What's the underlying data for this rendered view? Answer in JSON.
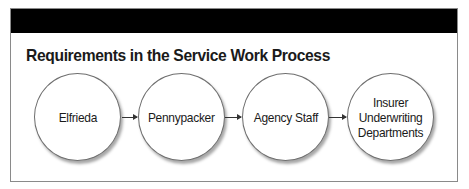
{
  "diagram": {
    "title": "Requirements in the Service Work Process",
    "header_band_color": "#000000",
    "nodes": [
      {
        "label": "Elfrieda"
      },
      {
        "label": "Pennypacker"
      },
      {
        "label": "Agency Staff"
      },
      {
        "label": "Insurer\nUnderwriting\nDepartments"
      }
    ],
    "edges": [
      {
        "from": "Elfrieda",
        "to": "Pennypacker"
      },
      {
        "from": "Pennypacker",
        "to": "Agency Staff"
      },
      {
        "from": "Agency Staff",
        "to": "Insurer Underwriting Departments"
      }
    ]
  }
}
